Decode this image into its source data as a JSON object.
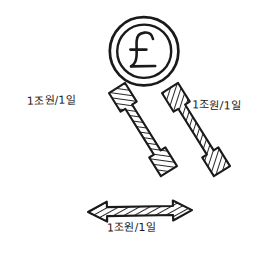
{
  "figure": {
    "type": "node-edge-diagram",
    "style": "hand-drawn-sketch",
    "background_color": "#ffffff",
    "ink_color": "#1a1a1a"
  },
  "nodes": [
    {
      "id": "gbp",
      "icon": "pound-coin-icon",
      "symbol": "£",
      "label": "£",
      "position": "top",
      "cx": 144,
      "cy": 51,
      "outer_r": 34,
      "inner_r": 27
    },
    {
      "id": "eur",
      "icon": "euro-coin-icon",
      "symbol": "€",
      "label": "€",
      "position": "bottom-left",
      "cx": 50,
      "cy": 210,
      "outer_r": 32,
      "inner_r": 25
    },
    {
      "id": "usd",
      "icon": "dollar-coin-icon",
      "symbol": "$",
      "label": "$",
      "position": "bottom-right",
      "cx": 234,
      "cy": 213,
      "outer_r": 32,
      "inner_r": 25
    }
  ],
  "edges": [
    {
      "id": "edge-gbp-eur",
      "from": "gbp",
      "to": "eur",
      "direction": "bidirectional",
      "arrow_style": "hatched-double-headed",
      "label": "1조원/1일"
    },
    {
      "id": "edge-gbp-usd",
      "from": "gbp",
      "to": "usd",
      "direction": "bidirectional",
      "arrow_style": "hatched-double-headed",
      "label": "1조원/1일"
    },
    {
      "id": "edge-eur-usd",
      "from": "eur",
      "to": "usd",
      "direction": "bidirectional",
      "arrow_style": "hatched-double-headed",
      "label": "1조원/1일"
    }
  ]
}
